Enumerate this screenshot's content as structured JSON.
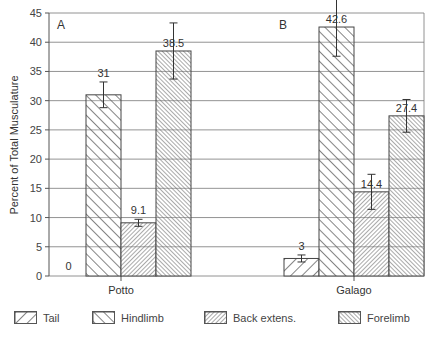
{
  "chart_data": {
    "type": "bar",
    "title": "",
    "xlabel": "",
    "ylabel": "Percent of Total Musculature",
    "ylim": [
      0,
      45
    ],
    "yticks": [
      0,
      5,
      10,
      15,
      20,
      25,
      30,
      35,
      40,
      45
    ],
    "grid": true,
    "categories": [
      "Potto",
      "Galago"
    ],
    "panel_labels": [
      "A",
      "B"
    ],
    "series": [
      {
        "name": "Tail",
        "values": [
          0,
          3
        ],
        "pattern": "diag-up-wide"
      },
      {
        "name": "Hindlimb",
        "values": [
          31,
          42.6
        ],
        "pattern": "diag-down-wide"
      },
      {
        "name": "Back extens.",
        "values": [
          9.1,
          14.4
        ],
        "pattern": "diag-up-dense"
      },
      {
        "name": "Forelimb",
        "values": [
          38.5,
          27.4
        ],
        "pattern": "diag-down-dense"
      }
    ],
    "error_bars": {
      "Potto": {
        "Hindlimb": 2.2,
        "Back extens.": 0.6,
        "Forelimb": 4.8
      },
      "Galago": {
        "Tail": 0.6,
        "Hindlimb": 5.0,
        "Back extens.": 3.0,
        "Forelimb": 2.8
      }
    },
    "data_labels": {
      "Potto": [
        "0",
        "31",
        "9.1",
        "38.5"
      ],
      "Galago": [
        "3",
        "42.6",
        "14.4",
        "27.4"
      ]
    },
    "legend_position": "bottom"
  },
  "legend": [
    {
      "label": "Tail"
    },
    {
      "label": "Hindlimb"
    },
    {
      "label": "Back extens."
    },
    {
      "label": "Forelimb"
    }
  ]
}
